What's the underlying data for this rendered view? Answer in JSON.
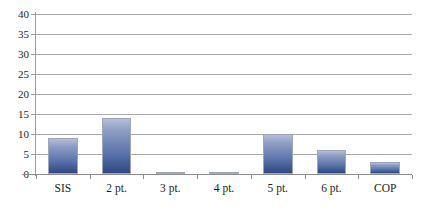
{
  "chart_data": {
    "type": "bar",
    "title": "",
    "subtitle": "",
    "xlabel": "",
    "ylabel": "",
    "categories": [
      "SIS",
      "2 pt.",
      "3 pt.",
      "4 pt.",
      "5 pt.",
      "6 pt.",
      "COP"
    ],
    "values": [
      9,
      14,
      0.2,
      0.2,
      10,
      6,
      3
    ],
    "series": [
      {
        "name": "",
        "values": [
          9,
          14,
          0.2,
          0.2,
          10,
          6,
          3
        ]
      }
    ],
    "ylim": [
      0,
      40
    ],
    "ytick_values": [
      0,
      5,
      10,
      15,
      20,
      25,
      30,
      35,
      40
    ],
    "ytick_labels": [
      "0",
      "5",
      "10",
      "15",
      "20",
      "25",
      "30",
      "35",
      "40"
    ],
    "ytick_interval": 5,
    "grid": true,
    "grid_axis": "y",
    "legend": false,
    "legend_position": "none",
    "annotations": [],
    "colors": {
      "bar_top": "#b4bedb",
      "bar_bottom": "#32497f",
      "bar_outline": "#9fa6b8",
      "gridline": "#8f8f8f",
      "axis": "#9a9a9a",
      "text": "#231f20",
      "background": "#ffffff"
    }
  }
}
